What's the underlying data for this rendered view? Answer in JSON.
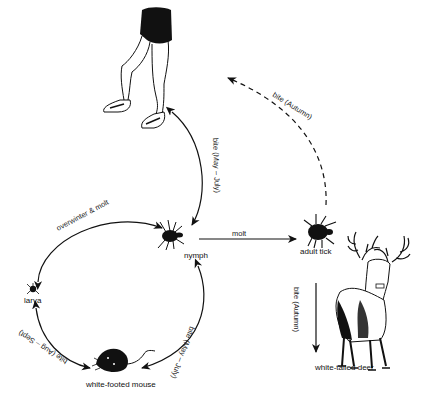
{
  "diagram": {
    "title": "",
    "type": "life-cycle",
    "nodes": {
      "human": {
        "label": "",
        "icon": "human-legs-icon"
      },
      "nymph": {
        "label": "nymph",
        "icon": "nymph-tick-icon"
      },
      "larva": {
        "label": "larva",
        "icon": "larva-tick-icon"
      },
      "adult_tick": {
        "label": "adult tick",
        "icon": "adult-tick-icon"
      },
      "mouse": {
        "label": "white-footed mouse",
        "icon": "mouse-icon"
      },
      "deer": {
        "label": "white-tailed deer",
        "icon": "deer-icon"
      }
    },
    "edges": {
      "adult_to_human": {
        "label": "bite (Autumn)",
        "style": "dashed"
      },
      "nymph_to_human": {
        "label": "bite (May – July)",
        "style": "solid"
      },
      "larva_to_nymph": {
        "label": "overwinter & molt",
        "style": "solid"
      },
      "nymph_to_adult": {
        "label": "molt",
        "style": "solid"
      },
      "adult_to_deer": {
        "label": "bite (Autumn)",
        "style": "solid"
      },
      "larva_to_mouse": {
        "label": "bite (Aug – Sept)",
        "style": "solid"
      },
      "nymph_to_mouse": {
        "label": "bite (May – July)",
        "style": "solid"
      }
    }
  },
  "colors": {
    "background": "#ffffff",
    "ink": "#111111"
  }
}
